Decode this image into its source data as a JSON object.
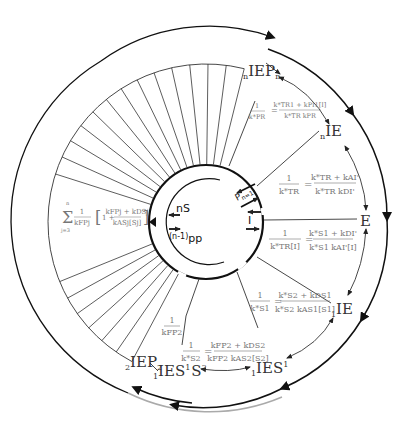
{
  "diagram": {
    "type": "enzyme kinetic cycle diagram",
    "center": [
      204,
      222
    ],
    "radii": {
      "outer": 186,
      "fan_outer": 158,
      "inner": 57,
      "inner_arc": 43
    },
    "colors": {
      "line": "#111111",
      "formula": "#777777",
      "label": "#333333",
      "gray_arc": "#aaaaaa"
    },
    "fan_line_count": 26
  },
  "states": {
    "nIEPn": {
      "pre": "n",
      "main": "IEP",
      "sub": "n"
    },
    "nIE": {
      "pre": "n",
      "main": "IE"
    },
    "E": {
      "main": "E"
    },
    "1IE": {
      "pre": "1",
      "main": "IE"
    },
    "1IES1": {
      "pre": "1",
      "main": "IES",
      "sup": "1"
    },
    "1IES1S2": {
      "pre": "1",
      "main": "IES",
      "sup": "1",
      "main2": "S",
      "sup2": "2"
    },
    "2IEP2": {
      "pre": "2",
      "main": "IEP",
      "sub": "2"
    }
  },
  "inner": {
    "nS": "nS",
    "pp_pre": "(n-1)",
    "pp": "pp",
    "P": "P",
    "P_sub": "n=1",
    "I": "I"
  },
  "formulas": {
    "f_PR": {
      "lhs_num": "1",
      "lhs_den": "k*PR",
      "rhs_num": "k*TR1 + kPI1[I]",
      "rhs_den": "k*TR kPR"
    },
    "f_TR": {
      "lhs_num": "1",
      "lhs_den": "k*TR",
      "rhs_num": "k*TR + kAI'",
      "rhs_den": "k*TR kDI'"
    },
    "f_TRI": {
      "lhs_num": "1",
      "lhs_den": "k*TR[I]",
      "rhs_num": "k*S1 + kDI'",
      "rhs_den": "k*S1 kAI'[I]"
    },
    "f_S1": {
      "lhs_num": "1",
      "lhs_den": "k*S1",
      "rhs_num": "k*S2 + kDS1",
      "rhs_den": "k*S2 kAS1[S1]"
    },
    "f_S2": {
      "lhs_num": "1",
      "lhs_den": "k*S2",
      "rhs_num": "kFP2 + kDS2",
      "rhs_den": "kFP2 kAS2[S2]"
    },
    "f_FP2": {
      "num": "1",
      "den": "kFP2"
    },
    "f_sum": {
      "sum_top": "n",
      "sum_bot": "j=3",
      "num": "1",
      "den": "kFPj",
      "br_num": "kFPj + kDSj",
      "br_den": "kASj[Sj]"
    }
  }
}
